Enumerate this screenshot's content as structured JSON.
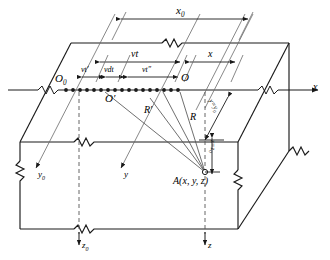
{
  "figure": {
    "type": "physics-geometry-diagram",
    "stroke_color": "#1a1a1a",
    "dash_color": "#555555",
    "background": "#ffffff"
  },
  "dimensions": {
    "x0": "x",
    "x0_sub": "0",
    "vt": "vt",
    "x": "x",
    "vt_prime": "vt′",
    "vdt": "vdt",
    "vt_dprime": "vt″"
  },
  "origins": {
    "O0": "O",
    "O0_sub": "0",
    "O_prime": "O′",
    "O": "O"
  },
  "rays": {
    "R_prime": "R′",
    "R": "R"
  },
  "axes": {
    "x": "x",
    "y0": "y",
    "y0_sub": "0",
    "y": "y",
    "z0": "z",
    "z0_sub": "0",
    "z": "z"
  },
  "point": {
    "label": "A(x, y, z)"
  },
  "side_labels": {
    "y_equals_y0": "y=y",
    "y_equals_y0_sub": "0",
    "z_equals_z0": "z=z",
    "z_equals_z0_sub": "0"
  },
  "source_points": {
    "count": 16,
    "marker": "filled-dot"
  }
}
